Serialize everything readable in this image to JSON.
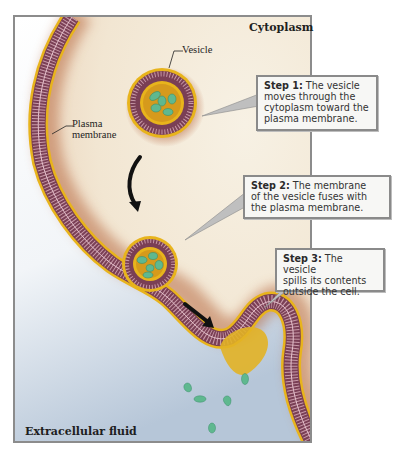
{
  "diagram": {
    "regions": {
      "cytoplasm": "Cytoplasm",
      "extracellular": "Extracellular fluid"
    },
    "labels": {
      "vesicle": "Vesicle",
      "plasma_membrane_line1": "Plasma",
      "plasma_membrane_line2": "membrane"
    },
    "steps": [
      {
        "label": "Step 1:",
        "lines": [
          "The vesicle",
          "moves through the",
          "cytoplasm toward the",
          "plasma membrane."
        ]
      },
      {
        "label": "Step 2:",
        "lines": [
          "The membrane",
          "of the vesicle fuses with",
          "the plasma membrane."
        ]
      },
      {
        "label": "Step 3:",
        "lines": [
          "The vesicle",
          "spills its contents",
          "outside the cell."
        ]
      }
    ],
    "colors": {
      "membrane_outer": "#e8b41c",
      "membrane_inner": "#7a3f55",
      "cargo": "#5fb88f",
      "cytoplasm": "#f3ead7",
      "cytoplasm_glow": "#b86c45",
      "extracellular": "#c9d5e2",
      "frame": "#8c8c8c",
      "arrow": "#111111"
    }
  }
}
